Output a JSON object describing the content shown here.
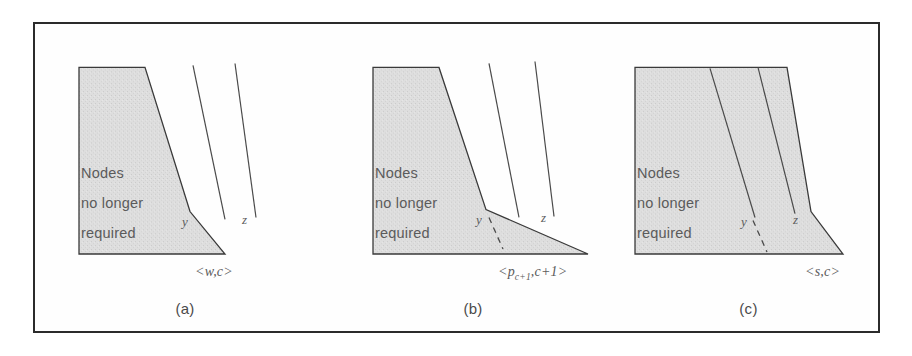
{
  "figure": {
    "panels": [
      {
        "id": "a",
        "caption": "(a)",
        "region_text_lines": [
          "Nodes",
          "no longer",
          "required"
        ],
        "line_labels": {
          "y": "y",
          "z": "z"
        },
        "vertex_label": "<w,c>",
        "vertex_label_parts": {
          "open": "<",
          "symbol": "w",
          "sep": ",",
          "second": "c",
          "close": ">"
        },
        "has_dashed_segment": false
      },
      {
        "id": "b",
        "caption": "(b)",
        "region_text_lines": [
          "Nodes",
          "no longer",
          "required"
        ],
        "line_labels": {
          "y": "y",
          "z": "z"
        },
        "vertex_label": "<p_{c+1},c+1>",
        "vertex_label_parts": {
          "open": "<",
          "symbol": "p",
          "subscript": "c+1",
          "sep": ",",
          "second": "c+1",
          "close": ">"
        },
        "has_dashed_segment": true
      },
      {
        "id": "c",
        "caption": "(c)",
        "region_text_lines": [
          "Nodes",
          "no longer",
          "required"
        ],
        "line_labels": {
          "y": "y",
          "z": "z"
        },
        "vertex_label": "<s,c>",
        "vertex_label_parts": {
          "open": "<",
          "symbol": "s",
          "sep": ",",
          "second": "c",
          "close": ">"
        },
        "has_dashed_segment": true
      }
    ]
  },
  "colors": {
    "frame_border": "#2b2b2b",
    "region_fill": "#dcdcdc",
    "region_stroke": "#3a3a3a",
    "page_background": "#ffffff",
    "text": "#5b5b5b",
    "line_stroke": "#4a4a4a"
  }
}
